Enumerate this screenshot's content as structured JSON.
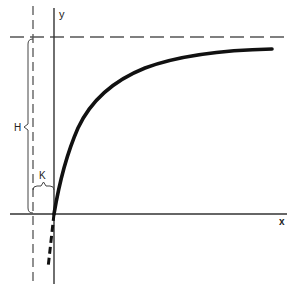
{
  "diagram": {
    "type": "saturation-curve",
    "axes": {
      "x_label": "x",
      "y_label": "y"
    },
    "annotations": {
      "H_label": "H",
      "K_label": "K"
    },
    "colors": {
      "curve": "#111111",
      "axis": "#333333",
      "dashed": "#555555",
      "background": "#ffffff"
    }
  }
}
